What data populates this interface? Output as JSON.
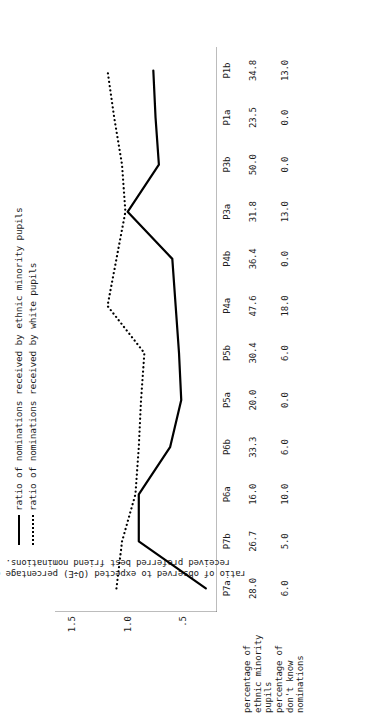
{
  "legend": {
    "items": [
      {
        "key": "solid-line",
        "label": "ratio of nominations received by ethnic minority pupils"
      },
      {
        "key": "dotted-line",
        "label": "ratio of nominations received by white pupils"
      }
    ]
  },
  "axis": {
    "ylabel": "ratio of observed to expected (O÷E) percentage of received preferred best friend nominations.",
    "yticks": [
      ".5",
      "1.0",
      "1.5"
    ]
  },
  "table": {
    "row1_header": "percentage of\nethnic minority\npupils",
    "row2_header": "percentage of\ndon't know\nnominations"
  },
  "chart_data": {
    "type": "line",
    "title": "",
    "xlabel": "",
    "ylabel": "ratio of observed to expected (O÷E) percentage of received preferred best friend nominations.",
    "ylim": [
      0.2,
      1.65
    ],
    "ytick_values": [
      0.5,
      1.0,
      1.5
    ],
    "ytick_labels": [
      ".5",
      "1.0",
      "1.5"
    ],
    "grid": false,
    "legend_position": "top-left",
    "categories": [
      "P7a",
      "P7b",
      "P6a",
      "P6b",
      "P5a",
      "P5b",
      "P4a",
      "P4b",
      "P3a",
      "P3b",
      "P1a",
      "P1b"
    ],
    "series": [
      {
        "name": "ratio of nominations received by ethnic minority pupils",
        "style": "solid",
        "color": "#000000",
        "values": [
          0.3,
          0.9,
          0.9,
          0.62,
          0.52,
          0.54,
          0.57,
          0.6,
          1.0,
          0.72,
          0.75,
          0.77
        ]
      },
      {
        "name": "ratio of nominations received by white pupils",
        "style": "dotted",
        "color": "#000000",
        "values": [
          1.1,
          1.05,
          0.93,
          0.9,
          0.88,
          0.85,
          1.18,
          1.1,
          1.02,
          1.05,
          1.12,
          1.18
        ]
      }
    ],
    "annotation_rows": [
      {
        "label": "percentage of ethnic minority pupils",
        "values": [
          "28.0",
          "26.7",
          "16.0",
          "33.3",
          "20.0",
          "30.4",
          "47.6",
          "36.4",
          "31.8",
          "50.0",
          "23.5",
          "34.8"
        ]
      },
      {
        "label": "percentage of don't know nominations",
        "values": [
          "6.0",
          "5.0",
          "10.0",
          "6.0",
          "0.0",
          "6.0",
          "18.0",
          "0.0",
          "13.0",
          "0.0",
          "0.0",
          "13.0"
        ]
      }
    ]
  }
}
